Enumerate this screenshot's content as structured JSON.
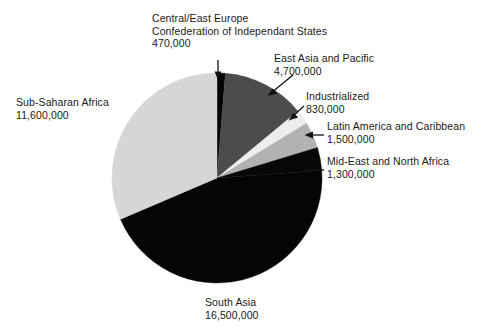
{
  "chart_data": {
    "type": "pie",
    "title": "",
    "total": 36900000,
    "legend_position": "callout-labels",
    "grid": false,
    "categories": [
      "Central/East Europe Confederation of Independant States",
      "East Asia and Pacific",
      "Industrialized",
      "Latin America and Caribbean",
      "Mid-East and North Africa",
      "South Asia",
      "Sub-Saharan Africa"
    ],
    "values": [
      470000,
      4700000,
      830000,
      1500000,
      1300000,
      16500000,
      11600000
    ],
    "value_labels": [
      "470,000",
      "4,700,000",
      "830,000",
      "1,500,000",
      "1,300,000",
      "16,500,000",
      "11,600,000"
    ],
    "colors": [
      "#050505",
      "#4c4c4c",
      "#ededed",
      "#b2b2b2",
      "#070707",
      "#050505",
      "#d6d6d6"
    ],
    "start_angle_deg": 0,
    "direction": "clockwise"
  },
  "slices": {
    "ceec": {
      "name_line1": "Central/East Europe",
      "name_line2": "Confederation of Independant States",
      "value": "470,000",
      "color": "#050505"
    },
    "eap": {
      "name": "East Asia and Pacific",
      "value": "4,700,000",
      "color": "#4c4c4c"
    },
    "ind": {
      "name": "Industrialized",
      "value": "830,000",
      "color": "#ededed"
    },
    "lac": {
      "name": "Latin America and Caribbean",
      "value": "1,500,000",
      "color": "#b2b2b2"
    },
    "mena": {
      "name": "Mid-East and North Africa",
      "value": "1,300,000",
      "color": "#070707"
    },
    "sa": {
      "name": "South Asia",
      "value": "16,500,000",
      "color": "#050505"
    },
    "ssa": {
      "name": "Sub-Saharan Africa",
      "value": "11,600,000",
      "color": "#d6d6d6"
    }
  },
  "geometry": {
    "center_x": 217,
    "center_y": 178,
    "radius": 105
  }
}
